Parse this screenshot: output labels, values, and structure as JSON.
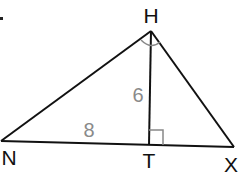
{
  "diagram": {
    "type": "right-triangle-altitude",
    "vertices": {
      "H": {
        "label": "H",
        "x": 151,
        "y": 31
      },
      "N": {
        "label": "N",
        "x": 1,
        "y": 141
      },
      "T": {
        "label": "T",
        "x": 149,
        "y": 145
      },
      "X": {
        "label": "X",
        "x": 234,
        "y": 147
      }
    },
    "segments": [
      {
        "from": "N",
        "to": "H"
      },
      {
        "from": "H",
        "to": "X"
      },
      {
        "from": "N",
        "to": "X"
      },
      {
        "from": "H",
        "to": "T"
      }
    ],
    "measurements": {
      "HT": "6",
      "NT": "8"
    },
    "right_angles": [
      "H",
      "T"
    ],
    "colors": {
      "lines": "#111111",
      "measure_text": "#8a8a8a",
      "angle_marks": "#888888"
    }
  }
}
